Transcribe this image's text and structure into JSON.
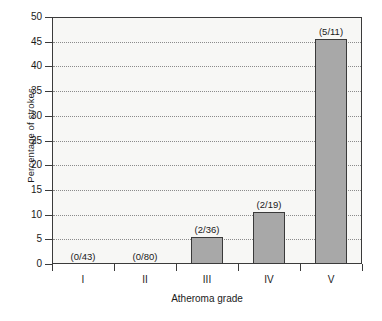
{
  "chart_data": {
    "type": "bar",
    "title": "",
    "xlabel": "Atheroma grade",
    "ylabel": "Percentage of strokes",
    "categories": [
      "I",
      "II",
      "III",
      "IV",
      "V"
    ],
    "values": [
      0,
      0,
      5.56,
      10.53,
      45.45
    ],
    "point_labels": [
      "(0/43)",
      "(0/80)",
      "(2/36)",
      "(2/19)",
      "(5/11)"
    ],
    "ylim": [
      0,
      50
    ],
    "yticks": [
      0,
      5,
      10,
      15,
      20,
      25,
      30,
      35,
      40,
      45,
      50
    ],
    "ytick_labels": [
      "0",
      "5",
      "10",
      "15",
      "20",
      "25",
      "30",
      "35",
      "40",
      "45",
      "50"
    ],
    "grid": "horizontal-dotted",
    "legend": "none",
    "bar_color": "#a8a8a8",
    "bar_edge_color": "#3a3a3a",
    "plot_bg_color": "#f7f7f5",
    "axis_color": "#3b3b3b",
    "gridline_color": "#8b8b8b"
  }
}
